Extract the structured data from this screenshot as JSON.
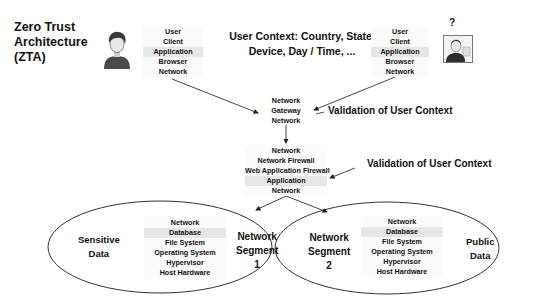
{
  "title": {
    "lines": [
      "Zero Trust",
      "Architecture",
      "(ZTA)"
    ]
  },
  "user_context": {
    "lines": [
      "User Context: Country, State,",
      "Device, Day / Time, ..."
    ]
  },
  "unknown_user_marker": "?",
  "icons": {
    "known_user": "user-avatar-icon",
    "unknown_user": "id-card-person-icon"
  },
  "client_stack_left": {
    "rows": [
      "User",
      "Client",
      "Application",
      "Browser",
      "Network"
    ],
    "highlight": "Application"
  },
  "client_stack_right": {
    "rows": [
      "User",
      "Client",
      "Application",
      "Browser",
      "Network"
    ],
    "highlight": "Application"
  },
  "gateway_stack": {
    "rows": [
      "Network",
      "Gateway",
      "Network"
    ]
  },
  "firewall_stack": {
    "rows": [
      "Network",
      "Network Firewall",
      "Web Application Firewall",
      "Application",
      "Network"
    ],
    "highlight": "Application"
  },
  "validation_labels": [
    "Validation of User Context",
    "Validation of User Context"
  ],
  "segment_1": {
    "data_label": [
      "Sensitive",
      "Data"
    ],
    "segment_label": [
      "Network",
      "Segment",
      "1"
    ],
    "stack": [
      "Network",
      "Database",
      "File System",
      "Operating System",
      "Hypervisor",
      "Host Hardware"
    ],
    "highlight": "Database"
  },
  "segment_2": {
    "data_label": [
      "Public",
      "Data"
    ],
    "segment_label": [
      "Network",
      "Segment",
      "2"
    ],
    "stack": [
      "Network",
      "Database",
      "File System",
      "Operating System",
      "Hypervisor",
      "Host Hardware"
    ],
    "highlight": "Database"
  },
  "colors": {
    "text": "#111111",
    "highlight_row": "#e6e6e6",
    "line": "#333333",
    "avatar_dark": "#4a4a4a"
  }
}
